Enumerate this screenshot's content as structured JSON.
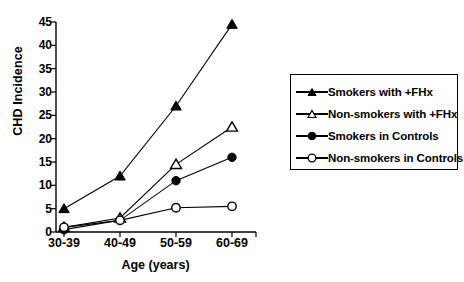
{
  "chart_data": {
    "type": "line",
    "title": "",
    "xlabel": "Age (years)",
    "ylabel": "CHD Incidence",
    "categories": [
      "30-39",
      "40-49",
      "50-59",
      "60-69"
    ],
    "ylim": [
      0,
      45
    ],
    "yticks": [
      0,
      5,
      10,
      15,
      20,
      25,
      30,
      35,
      40,
      45
    ],
    "grid": false,
    "legend_position": "right",
    "series": [
      {
        "name": "Smokers with +FHx",
        "marker": "filled-triangle",
        "values": [
          5,
          12,
          27,
          44.5
        ]
      },
      {
        "name": "Non-smokers with +FHx",
        "marker": "open-triangle",
        "values": [
          1,
          3,
          14.5,
          22.5
        ]
      },
      {
        "name": "Smokers in Controls",
        "marker": "filled-circle",
        "values": [
          0.5,
          2.5,
          11,
          16
        ]
      },
      {
        "name": "Non-smokers in Controls",
        "marker": "open-circle",
        "values": [
          1,
          2.5,
          5.2,
          5.5
        ]
      }
    ]
  },
  "axes": {
    "y_title": "CHD Incidence",
    "x_title": "Age (years)",
    "y_tick_labels": [
      "0",
      "5",
      "10",
      "15",
      "20",
      "25",
      "30",
      "35",
      "40",
      "45"
    ],
    "x_tick_labels": [
      "30-39",
      "40-49",
      "50-59",
      "60-69"
    ]
  },
  "legend": {
    "items": [
      {
        "label": "Smokers with +FHx",
        "marker": "filled-triangle"
      },
      {
        "label": "Non-smokers with +FHx",
        "marker": "open-triangle"
      },
      {
        "label": "Smokers in Controls",
        "marker": "filled-circle"
      },
      {
        "label": "Non-smokers in Controls",
        "marker": "open-circle"
      }
    ]
  },
  "colors": {
    "foreground": "#000000",
    "background": "#ffffff"
  }
}
